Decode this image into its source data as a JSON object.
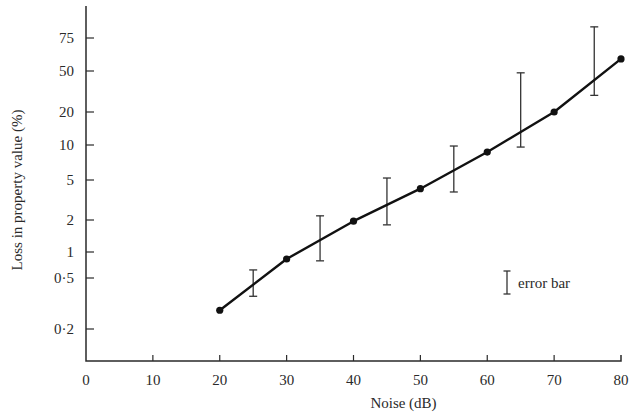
{
  "chart_data": {
    "type": "line",
    "title": "",
    "xlabel": "Noise (dB)",
    "ylabel": "Loss in property value (%)",
    "y_scale": "log-like (non-uniform)",
    "xlim": [
      0,
      80
    ],
    "x_ticks": [
      0,
      10,
      20,
      30,
      40,
      50,
      60,
      70,
      80
    ],
    "x_tick_labels": [
      "0",
      "10",
      "20",
      "30",
      "40",
      "50",
      "60",
      "70",
      "80"
    ],
    "y_ticks": [
      0.2,
      0.5,
      1,
      2,
      5,
      10,
      20,
      50,
      75
    ],
    "y_tick_labels": [
      "0·2",
      "0·5",
      "1",
      "2",
      "5",
      "10",
      "20",
      "50",
      "75"
    ],
    "grid": false,
    "series": [
      {
        "name": "Loss in property value",
        "x": [
          20,
          30,
          40,
          50,
          60,
          70,
          80
        ],
        "values": [
          0.28,
          0.83,
          1.95,
          4.1,
          8.7,
          20,
          58
        ],
        "marker": "filled-circle"
      }
    ],
    "error_bars": [
      {
        "x": 25,
        "low": 0.36,
        "high": 0.62
      },
      {
        "x": 35,
        "low": 0.79,
        "high": 2.2
      },
      {
        "x": 45,
        "low": 1.8,
        "high": 5.2
      },
      {
        "x": 55,
        "low": 3.8,
        "high": 9.8
      },
      {
        "x": 65,
        "low": 9.6,
        "high": 48
      },
      {
        "x": 76,
        "low": 29,
        "high": 86
      }
    ],
    "legend": {
      "entries": [
        "error bar"
      ],
      "position": "right-middle"
    }
  },
  "layout": {
    "plot_left": 86,
    "plot_right": 621,
    "x_axis_y": 361,
    "y_axis_top": 6,
    "y_tick_pixels": [
      329,
      278,
      252,
      220,
      180,
      145,
      112,
      71,
      38
    ],
    "legend_x": 507,
    "legend_y": 283
  }
}
